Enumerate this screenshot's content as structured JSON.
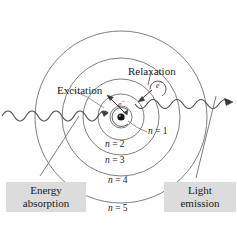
{
  "figure": {
    "background_color": "#ffffff",
    "line_color": "#6b6b6b",
    "dark_line_color": "#3a3a3a",
    "text_color": "#1a1a1a",
    "callout_background": "#dcdcdc"
  },
  "orbits": [
    {
      "id": "n1",
      "label_n": "n",
      "label_eq": " = ",
      "label_num": "1",
      "label": "n = 1"
    },
    {
      "id": "n2",
      "label_n": "n",
      "label_eq": " = ",
      "label_num": "2",
      "label": "n = 2"
    },
    {
      "id": "n3",
      "label_n": "n",
      "label_eq": " = ",
      "label_num": "3",
      "label": "n = 3"
    },
    {
      "id": "n4",
      "label_n": "n",
      "label_eq": " = ",
      "label_num": "4",
      "label": "n = 4"
    },
    {
      "id": "n5",
      "label_n": "n",
      "label_eq": " = ",
      "label_num": "5",
      "label": "n = 5"
    }
  ],
  "annotations": {
    "excitation": "Excitation",
    "relaxation": "Relaxation",
    "electron_symbol": "e",
    "electron_charge": "–"
  },
  "callouts": {
    "energy_absorption": {
      "line1": "Energy",
      "line2": "absorption"
    },
    "light_emission": {
      "line1": "Light",
      "line2": "emission"
    }
  }
}
